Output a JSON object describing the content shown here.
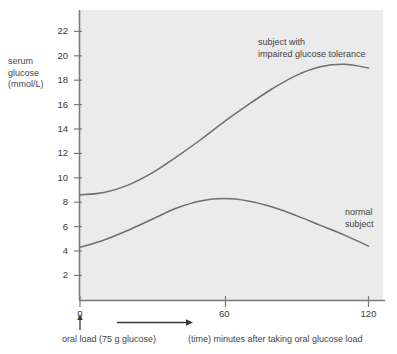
{
  "chart_data": {
    "type": "line",
    "title": "",
    "xlabel": "(time) minutes after taking oral glucose load",
    "ylabel": "serum glucose (mmol/L)",
    "ylabel_lines": [
      "serum",
      "glucose",
      "(mmol/L)"
    ],
    "xlim": [
      0,
      132
    ],
    "ylim": [
      0,
      23.5
    ],
    "grid": false,
    "legend_position": "inline-annotations",
    "yticks": [
      2,
      4,
      6,
      8,
      10,
      12,
      14,
      16,
      18,
      20,
      22
    ],
    "ytick_labels": [
      "2",
      "4",
      "6",
      "8",
      "10",
      "12",
      "14",
      "16",
      "18",
      "20",
      "22"
    ],
    "xticks": [
      0,
      60,
      120
    ],
    "xtick_labels": [
      "0",
      "60",
      "120"
    ],
    "series": [
      {
        "name": "subject with impaired glucose tolerance",
        "label_lines": [
          "subject with",
          "impaired glucose tolerance"
        ],
        "color": "#6e6e6e",
        "x": [
          0,
          10,
          20,
          30,
          40,
          50,
          60,
          70,
          80,
          90,
          100,
          110,
          120
        ],
        "values": [
          8.6,
          8.8,
          9.4,
          10.4,
          11.7,
          13.1,
          14.6,
          16.0,
          17.3,
          18.4,
          19.1,
          19.3,
          19.0
        ]
      },
      {
        "name": "normal subject",
        "label_lines": [
          "normal",
          "subject"
        ],
        "color": "#6e6e6e",
        "x": [
          0,
          10,
          20,
          30,
          40,
          50,
          60,
          70,
          80,
          90,
          100,
          110,
          120
        ],
        "values": [
          4.3,
          4.9,
          5.7,
          6.6,
          7.5,
          8.1,
          8.3,
          8.1,
          7.6,
          6.9,
          6.1,
          5.3,
          4.4
        ]
      }
    ],
    "annotations": [
      {
        "name": "oral-load-marker",
        "text": "oral load (75 g glucose)",
        "at_x": 0,
        "marker": "up-arrow"
      },
      {
        "name": "time-axis-arrow",
        "text": "(time) minutes after taking oral glucose load",
        "marker": "right-arrow"
      }
    ],
    "plot_background": "#ebebeb",
    "axis_color": "#7a7a7a"
  }
}
